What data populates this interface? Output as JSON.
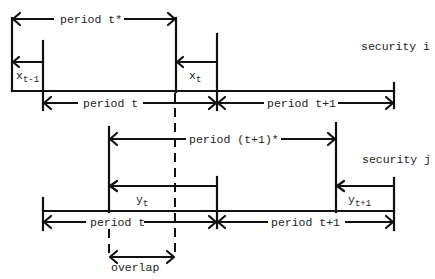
{
  "diagram": {
    "security_i": {
      "label": "security i",
      "period_star": "period t*",
      "x_prev": {
        "base": "x",
        "sub": "t-1"
      },
      "x_curr": {
        "base": "x",
        "sub": "t"
      },
      "period_t": "period t",
      "period_t1": "period t+1"
    },
    "security_j": {
      "label": "security j",
      "period_star": "period (t+1)*",
      "y_curr": {
        "base": "y",
        "sub": "t"
      },
      "y_next": {
        "base": "y",
        "sub": "t+1"
      },
      "period_t": "period t",
      "period_t1": "period t+1"
    },
    "overlap": "overlap"
  }
}
